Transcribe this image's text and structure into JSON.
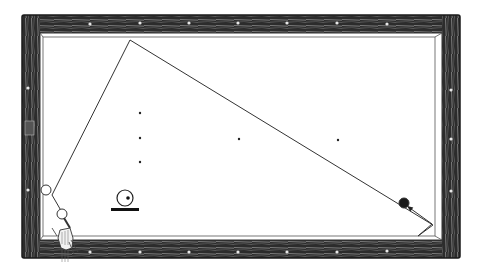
{
  "diagram": {
    "colors": {
      "background": "#ffffff",
      "rail_wood": "#2a2a2a",
      "rail_grain": "#9a9a9a",
      "line": "#333333",
      "ball_fill_dark": "#1a1a1a"
    },
    "table": {
      "outer": {
        "x": 22,
        "y": 15,
        "w": 438,
        "h": 243
      },
      "cushion": {
        "x": 40,
        "y": 33,
        "w": 402,
        "h": 207
      },
      "surface": {
        "x": 43,
        "y": 37,
        "w": 392,
        "h": 199
      }
    },
    "rail_diamonds": [
      {
        "x": 90,
        "y": 24
      },
      {
        "x": 140,
        "y": 23
      },
      {
        "x": 189,
        "y": 23
      },
      {
        "x": 238,
        "y": 23
      },
      {
        "x": 287,
        "y": 23
      },
      {
        "x": 337,
        "y": 23
      },
      {
        "x": 387,
        "y": 24
      },
      {
        "x": 28,
        "y": 88
      },
      {
        "x": 28,
        "y": 190
      },
      {
        "x": 451,
        "y": 90
      },
      {
        "x": 451,
        "y": 139
      },
      {
        "x": 451,
        "y": 191
      },
      {
        "x": 90,
        "y": 252
      },
      {
        "x": 140,
        "y": 252
      },
      {
        "x": 189,
        "y": 252
      },
      {
        "x": 238,
        "y": 252
      },
      {
        "x": 287,
        "y": 252
      },
      {
        "x": 337,
        "y": 252
      },
      {
        "x": 387,
        "y": 251
      }
    ],
    "spots": [
      {
        "x": 140,
        "y": 113
      },
      {
        "x": 140,
        "y": 138
      },
      {
        "x": 140,
        "y": 162
      },
      {
        "x": 239,
        "y": 139
      },
      {
        "x": 338,
        "y": 140
      }
    ],
    "balls": [
      {
        "name": "object-ball-left",
        "x": 46,
        "y": 190,
        "r": 5,
        "filled": false
      },
      {
        "name": "cue-ball",
        "x": 62,
        "y": 214,
        "r": 5,
        "filled": false
      },
      {
        "name": "target-ball",
        "x": 404,
        "y": 203,
        "r": 5,
        "filled": true
      }
    ],
    "path": {
      "points": [
        [
          63,
          214
        ],
        [
          52,
          195
        ],
        [
          130,
          40
        ],
        [
          433,
          225
        ],
        [
          418,
          236
        ],
        [
          432,
          224
        ]
      ],
      "arrow_to": [
        407,
        206
      ]
    },
    "english_symbol": {
      "ball": {
        "x": 125,
        "y": 198,
        "r": 8
      },
      "dot": {
        "x": 128,
        "y": 198,
        "r": 1.8
      },
      "bar": {
        "x": 111,
        "y": 208,
        "w": 28,
        "h": 3
      }
    },
    "hand": {
      "x": 64,
      "y": 232
    }
  }
}
